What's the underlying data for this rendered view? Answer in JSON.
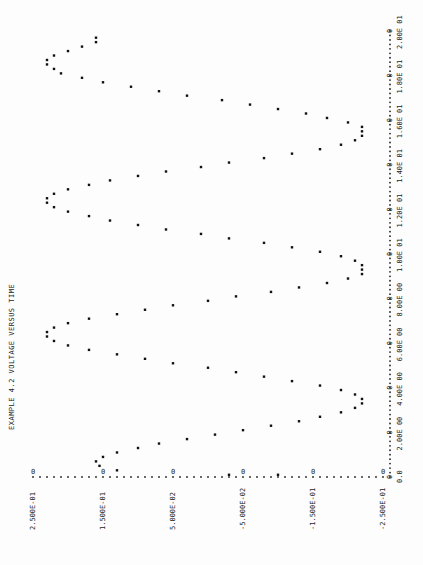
{
  "chart_data": {
    "type": "scatter",
    "title": "EXAMPLE 4.2 VOLTAGE VERSUS TIME",
    "xlabel": "",
    "ylabel": "",
    "orientation": "rotated-90 (time axis vertical on right, voltage axis horizontal on bottom)",
    "x_ticks": [
      "0.0",
      "2.00E 00",
      "4.00E 00",
      "6.00E 00",
      "8.00E 00",
      "1.00E 01",
      "1.20E 01",
      "1.40E 01",
      "1.60E 01",
      "1.80E 01",
      "2.00E 01"
    ],
    "x_tick_values": [
      0,
      2,
      4,
      6,
      8,
      10,
      12,
      14,
      16,
      18,
      20
    ],
    "y_ticks": [
      "2.500E-01",
      "1.500E-01",
      "5.000E-02",
      "-5.000E-02",
      "-1.500E-01",
      "-2.500E-01"
    ],
    "y_tick_values": [
      0.25,
      0.15,
      0.05,
      -0.05,
      -0.15,
      -0.25
    ],
    "xlim": [
      0,
      20
    ],
    "ylim": [
      -0.25,
      0.25
    ],
    "grid": false,
    "marker": "*",
    "series": [
      {
        "name": "voltage",
        "x": [
          0.1,
          0.1,
          0.3,
          0.5,
          0.7,
          0.9,
          1.1,
          1.3,
          1.5,
          1.7,
          1.9,
          2.1,
          2.3,
          2.5,
          2.7,
          2.9,
          3.1,
          3.3,
          3.5,
          3.7,
          3.9,
          4.1,
          4.3,
          4.5,
          4.7,
          4.9,
          5.1,
          5.3,
          5.5,
          5.7,
          5.9,
          6.1,
          6.3,
          6.5,
          6.7,
          6.9,
          7.1,
          7.3,
          7.5,
          7.7,
          7.9,
          8.1,
          8.3,
          8.5,
          8.7,
          8.9,
          9.1,
          9.3,
          9.5,
          9.7,
          9.9,
          10.1,
          10.3,
          10.5,
          10.7,
          10.9,
          11.1,
          11.3,
          11.5,
          11.7,
          11.9,
          12.1,
          12.3,
          12.5,
          12.7,
          12.9,
          13.1,
          13.3,
          13.5,
          13.7,
          13.9,
          14.1,
          14.3,
          14.5,
          14.7,
          14.9,
          15.1,
          15.3,
          15.5,
          15.7,
          15.9,
          16.1,
          16.3,
          16.5,
          16.7,
          16.9,
          17.1,
          17.3,
          17.5,
          17.7,
          17.9,
          18.1,
          18.3,
          18.5,
          18.7,
          18.9,
          19.1,
          19.3,
          19.5,
          19.7
        ],
        "y": [
          -0.03,
          -0.1,
          0.13,
          0.155,
          0.16,
          0.15,
          0.13,
          0.1,
          0.07,
          0.03,
          -0.01,
          -0.05,
          -0.09,
          -0.13,
          -0.16,
          -0.19,
          -0.21,
          -0.22,
          -0.22,
          -0.21,
          -0.19,
          -0.16,
          -0.12,
          -0.08,
          -0.04,
          0.0,
          0.05,
          0.09,
          0.13,
          0.17,
          0.2,
          0.22,
          0.23,
          0.23,
          0.22,
          0.2,
          0.17,
          0.13,
          0.09,
          0.05,
          0.0,
          -0.04,
          -0.09,
          -0.13,
          -0.17,
          -0.2,
          -0.22,
          -0.22,
          -0.22,
          -0.21,
          -0.19,
          -0.16,
          -0.12,
          -0.08,
          -0.03,
          0.01,
          0.06,
          0.1,
          0.14,
          0.17,
          0.2,
          0.22,
          0.23,
          0.23,
          0.22,
          0.2,
          0.17,
          0.14,
          0.1,
          0.06,
          0.01,
          -0.03,
          -0.08,
          -0.12,
          -0.16,
          -0.19,
          -0.21,
          -0.22,
          -0.22,
          -0.22,
          -0.2,
          -0.17,
          -0.14,
          -0.1,
          -0.06,
          -0.02,
          0.03,
          0.07,
          0.11,
          0.15,
          0.18,
          0.21,
          0.22,
          0.23,
          0.23,
          0.22,
          0.2,
          0.18,
          0.16,
          0.16
        ]
      }
    ]
  }
}
